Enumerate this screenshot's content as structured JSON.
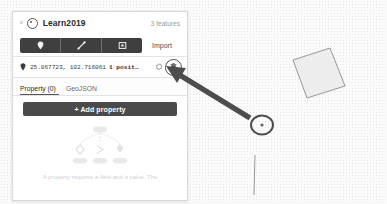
{
  "app": {
    "project_title": "Learn2019",
    "feature_count_label": "3 features",
    "back_label": "‹"
  },
  "toolbar": {
    "tools": [
      {
        "name": "draw-point-tool",
        "icon": "map-pin-icon",
        "title": "Point"
      },
      {
        "name": "draw-line-tool",
        "icon": "line-icon",
        "title": "Line"
      },
      {
        "name": "draw-polygon-tool",
        "icon": "polygon-icon",
        "title": "Polygon"
      }
    ],
    "import_label": "Import"
  },
  "feature": {
    "coords": "25.067723, 102.716061",
    "position_label": "1 posit…",
    "gear_icon": "gear-icon",
    "delete_icon": "trash-icon"
  },
  "tabs": [
    {
      "label": "Property (0)",
      "active": true,
      "name": "tab-property"
    },
    {
      "label": "GeoJSON",
      "active": false,
      "name": "tab-geojson"
    }
  ],
  "actions": {
    "add_property_label": "+ Add property"
  },
  "empty_state": {
    "hint": "A property requires a field and a value. The"
  },
  "colors": {
    "panel_bg": "#ffffff",
    "toolbar_dark": "#3f3f3f",
    "button_dark": "#4a4a4a",
    "map_bg": "#fbfbfb",
    "annotation": "#4d4d4d",
    "text_primary": "#2b2b2b",
    "text_muted": "#9b9b9b"
  },
  "map": {
    "features": [
      {
        "name": "polygon-feature",
        "type": "polygon"
      },
      {
        "name": "point-feature",
        "type": "point"
      },
      {
        "name": "line-feature",
        "type": "line"
      }
    ]
  }
}
